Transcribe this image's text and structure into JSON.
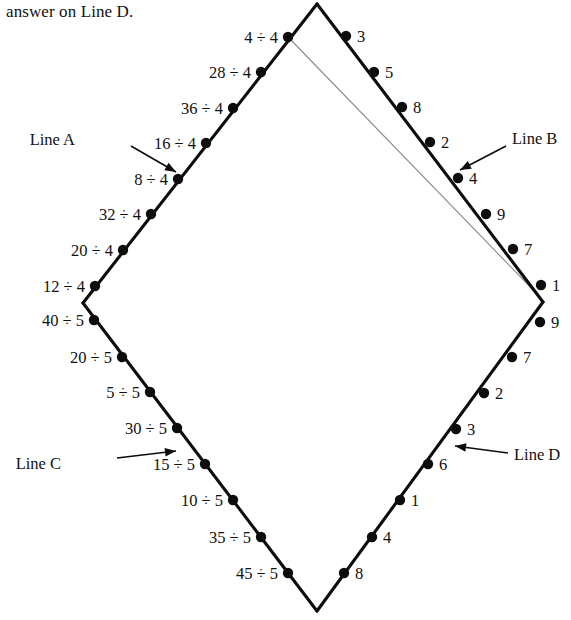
{
  "header": {
    "text": "answer on Line D."
  },
  "colors": {
    "ink": "#0d0d0d",
    "thin_line": "#8a8a8a",
    "background": "#ffffff"
  },
  "diagram": {
    "type": "diamond-number-path",
    "vertices": {
      "top": [
        317,
        4
      ],
      "left": [
        83,
        303
      ],
      "right": [
        543,
        302
      ],
      "bottom": [
        317,
        611
      ]
    },
    "thin_guide_line": {
      "from": [
        288,
        37
      ],
      "to": [
        540,
        297
      ]
    }
  },
  "lines": [
    {
      "id": "A",
      "label": "Line A",
      "label_pos": [
        75,
        140
      ],
      "arrow": {
        "from": [
          131,
          146
        ],
        "to": [
          176,
          172
        ]
      },
      "edge": "upper-left",
      "label_side": "left",
      "points": [
        {
          "value": "4 ÷ 4",
          "dot": [
            288,
            37
          ],
          "label_pos": [
            278,
            38
          ]
        },
        {
          "value": "28 ÷ 4",
          "dot": [
            261,
            72
          ],
          "label_pos": [
            251,
            73
          ]
        },
        {
          "value": "36 ÷ 4",
          "dot": [
            233,
            108
          ],
          "label_pos": [
            223,
            109
          ]
        },
        {
          "value": "16 ÷ 4",
          "dot": [
            206,
            143
          ],
          "label_pos": [
            196,
            144
          ]
        },
        {
          "value": "8 ÷ 4",
          "dot": [
            178,
            179
          ],
          "label_pos": [
            168,
            180
          ]
        },
        {
          "value": "32 ÷ 4",
          "dot": [
            151,
            214
          ],
          "label_pos": [
            141,
            215
          ]
        },
        {
          "value": "20 ÷ 4",
          "dot": [
            123,
            250
          ],
          "label_pos": [
            113,
            251
          ]
        },
        {
          "value": "12 ÷ 4",
          "dot": [
            95,
            286
          ],
          "label_pos": [
            85,
            287
          ]
        }
      ]
    },
    {
      "id": "B",
      "label": "Line B",
      "label_pos": [
        512,
        139
      ],
      "arrow": {
        "from": [
          506,
          146
        ],
        "to": [
          460,
          170
        ]
      },
      "edge": "upper-right",
      "label_side": "right",
      "points": [
        {
          "value": "3",
          "dot": [
            346,
            36
          ],
          "label_pos": [
            357,
            37
          ]
        },
        {
          "value": "5",
          "dot": [
            374,
            72
          ],
          "label_pos": [
            385,
            73
          ]
        },
        {
          "value": "8",
          "dot": [
            402,
            107
          ],
          "label_pos": [
            413,
            108
          ]
        },
        {
          "value": "2",
          "dot": [
            430,
            142
          ],
          "label_pos": [
            441,
            143
          ]
        },
        {
          "value": "4",
          "dot": [
            458,
            178
          ],
          "label_pos": [
            469,
            179
          ]
        },
        {
          "value": "9",
          "dot": [
            486,
            214
          ],
          "label_pos": [
            497,
            215
          ]
        },
        {
          "value": "7",
          "dot": [
            513,
            249
          ],
          "label_pos": [
            524,
            250
          ]
        },
        {
          "value": "1",
          "dot": [
            541,
            285
          ],
          "label_pos": [
            552,
            286
          ]
        }
      ]
    },
    {
      "id": "C",
      "label": "Line C",
      "label_pos": [
        61,
        464
      ],
      "arrow": {
        "from": [
          117,
          458
        ],
        "to": [
          176,
          451
        ]
      },
      "edge": "lower-left",
      "label_side": "left",
      "points": [
        {
          "value": "40 ÷ 5",
          "dot": [
            94,
            320
          ],
          "label_pos": [
            84,
            321
          ]
        },
        {
          "value": "20 ÷ 5",
          "dot": [
            122,
            357
          ],
          "label_pos": [
            112,
            358
          ]
        },
        {
          "value": "5 ÷ 5",
          "dot": [
            150,
            392
          ],
          "label_pos": [
            140,
            393
          ]
        },
        {
          "value": "30 ÷ 5",
          "dot": [
            177,
            428
          ],
          "label_pos": [
            167,
            429
          ]
        },
        {
          "value": "15 ÷ 5",
          "dot": [
            205,
            464
          ],
          "label_pos": [
            195,
            465
          ]
        },
        {
          "value": "10 ÷ 5",
          "dot": [
            233,
            500
          ],
          "label_pos": [
            223,
            501
          ]
        },
        {
          "value": "35 ÷ 5",
          "dot": [
            261,
            537
          ],
          "label_pos": [
            251,
            538
          ]
        },
        {
          "value": "45 ÷ 5",
          "dot": [
            288,
            573
          ],
          "label_pos": [
            278,
            574
          ]
        }
      ]
    },
    {
      "id": "D",
      "label": "Line D",
      "label_pos": [
        514,
        455
      ],
      "arrow": {
        "from": [
          508,
          453
        ],
        "to": [
          455,
          446
        ]
      },
      "edge": "lower-right",
      "label_side": "right",
      "points": [
        {
          "value": "9",
          "dot": [
            540,
            322
          ],
          "label_pos": [
            551,
            323
          ]
        },
        {
          "value": "7",
          "dot": [
            512,
            357
          ],
          "label_pos": [
            523,
            358
          ]
        },
        {
          "value": "2",
          "dot": [
            484,
            393
          ],
          "label_pos": [
            495,
            394
          ]
        },
        {
          "value": "3",
          "dot": [
            456,
            429
          ],
          "label_pos": [
            467,
            430
          ]
        },
        {
          "value": "6",
          "dot": [
            428,
            464
          ],
          "label_pos": [
            439,
            465
          ]
        },
        {
          "value": "1",
          "dot": [
            400,
            500
          ],
          "label_pos": [
            411,
            501
          ]
        },
        {
          "value": "4",
          "dot": [
            372,
            537
          ],
          "label_pos": [
            383,
            538
          ]
        },
        {
          "value": "8",
          "dot": [
            344,
            573
          ],
          "label_pos": [
            355,
            574
          ]
        }
      ]
    }
  ]
}
